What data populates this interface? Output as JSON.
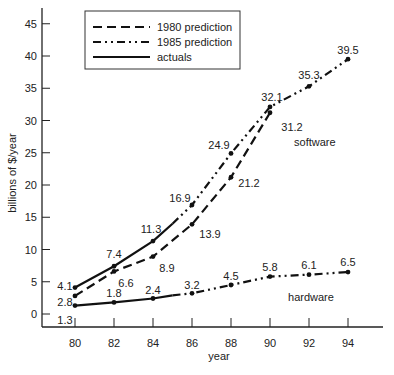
{
  "chart_data": {
    "type": "line",
    "title": "",
    "xlabel": "year",
    "ylabel": "billions of $/year",
    "xlim": [
      78.2,
      95.7
    ],
    "ylim": [
      -2,
      47
    ],
    "x_ticks": [
      80,
      82,
      84,
      86,
      88,
      90,
      92,
      94
    ],
    "y_ticks": [
      0,
      5,
      10,
      15,
      20,
      25,
      30,
      35,
      40,
      45
    ],
    "grid": false,
    "legend_position": "top-left (boxed)",
    "legend": [
      {
        "label": "1980 prediction",
        "style": "dashed"
      },
      {
        "label": "1985 prediction",
        "style": "dash-dot-dot"
      },
      {
        "label": "actuals",
        "style": "solid"
      }
    ],
    "annotations": [
      {
        "text": "software",
        "x": 92.3,
        "y": 26
      },
      {
        "text": "hardware",
        "x": 92.1,
        "y": 2
      }
    ],
    "series": [
      {
        "name": "software actuals",
        "style": "solid",
        "x": [
          80,
          82,
          84,
          85
        ],
        "y": [
          4.1,
          7.4,
          11.3,
          14.0
        ],
        "labels": [
          {
            "x": 80,
            "y": 4.1,
            "text": "4.1"
          },
          {
            "x": 82,
            "y": 7.4,
            "text": "7.4"
          },
          {
            "x": 84,
            "y": 11.3,
            "text": "11.3"
          }
        ]
      },
      {
        "name": "software 1980 prediction",
        "style": "dashed",
        "x": [
          80,
          82,
          84,
          86,
          88,
          90
        ],
        "y": [
          2.8,
          6.6,
          8.9,
          13.9,
          21.2,
          31.2
        ],
        "labels": [
          {
            "x": 80,
            "y": 2.8,
            "text": "2.8"
          },
          {
            "x": 82,
            "y": 6.6,
            "text": "6.6"
          },
          {
            "x": 84,
            "y": 8.9,
            "text": "8.9"
          },
          {
            "x": 86,
            "y": 13.9,
            "text": "13.9"
          },
          {
            "x": 88,
            "y": 21.2,
            "text": "21.2"
          },
          {
            "x": 90,
            "y": 31.2,
            "text": "31.2"
          }
        ]
      },
      {
        "name": "software 1985 prediction",
        "style": "dash-dot-dot",
        "x": [
          85,
          86,
          88,
          90,
          92,
          94
        ],
        "y": [
          14.0,
          16.9,
          24.9,
          32.1,
          35.3,
          39.5
        ],
        "labels": [
          {
            "x": 86,
            "y": 16.9,
            "text": "16.9"
          },
          {
            "x": 88,
            "y": 24.9,
            "text": "24.9"
          },
          {
            "x": 90,
            "y": 32.1,
            "text": "32.1"
          },
          {
            "x": 92,
            "y": 35.3,
            "text": "35.3"
          },
          {
            "x": 94,
            "y": 39.5,
            "text": "39.5"
          }
        ]
      },
      {
        "name": "hardware actuals",
        "style": "solid",
        "x": [
          80,
          82,
          84,
          85
        ],
        "y": [
          1.3,
          1.8,
          2.4,
          2.9
        ],
        "labels": [
          {
            "x": 80,
            "y": 1.3,
            "text": "1.3"
          },
          {
            "x": 82,
            "y": 1.8,
            "text": "1.8"
          },
          {
            "x": 84,
            "y": 2.4,
            "text": "2.4"
          }
        ]
      },
      {
        "name": "hardware 1985 prediction",
        "style": "dash-dot-dot",
        "x": [
          85,
          86,
          88,
          90,
          92,
          94
        ],
        "y": [
          2.9,
          3.2,
          4.5,
          5.8,
          6.1,
          6.5
        ],
        "labels": [
          {
            "x": 86,
            "y": 3.2,
            "text": "3.2"
          },
          {
            "x": 88,
            "y": 4.5,
            "text": "4.5"
          },
          {
            "x": 90,
            "y": 5.8,
            "text": "5.8"
          },
          {
            "x": 92,
            "y": 6.1,
            "text": "6.1"
          },
          {
            "x": 94,
            "y": 6.5,
            "text": "6.5"
          }
        ]
      }
    ]
  }
}
